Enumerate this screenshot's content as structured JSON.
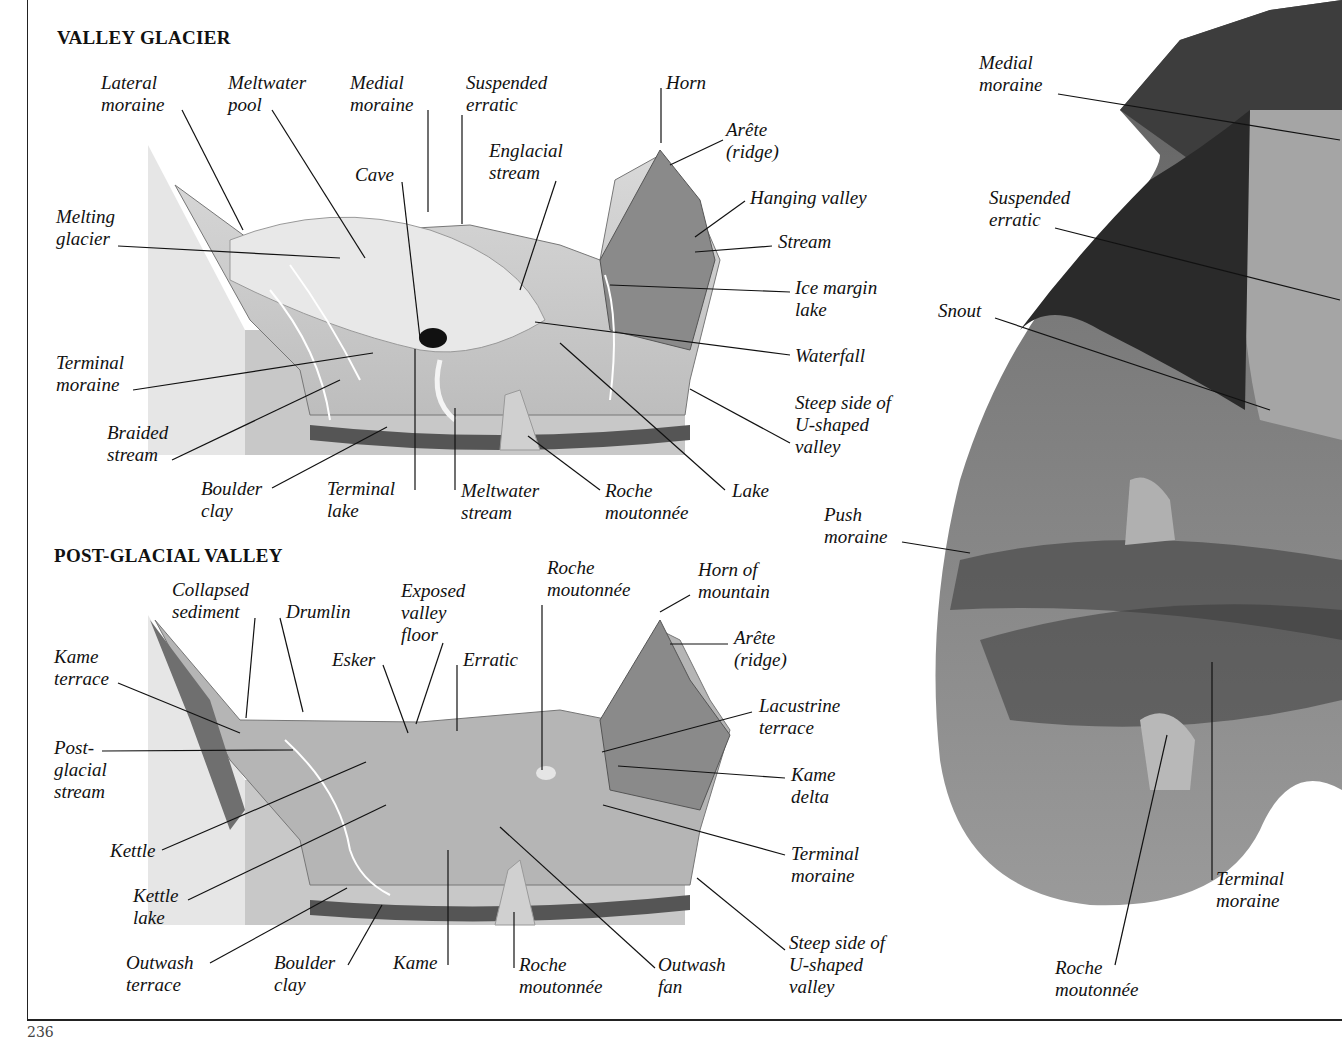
{
  "page": {
    "number": "236"
  },
  "valley_glacier": {
    "title": "VALLEY GLACIER",
    "labels": [
      {
        "id": "lateral-moraine",
        "text": "Lateral\nmoraine",
        "x": 101,
        "y": 72
      },
      {
        "id": "meltwater-pool",
        "text": "Meltwater\npool",
        "x": 228,
        "y": 72
      },
      {
        "id": "medial-moraine",
        "text": "Medial\nmoraine",
        "x": 350,
        "y": 72
      },
      {
        "id": "suspended-erratic",
        "text": "Suspended\nerratic",
        "x": 466,
        "y": 72
      },
      {
        "id": "horn",
        "text": "Horn",
        "x": 666,
        "y": 72
      },
      {
        "id": "arete",
        "text": "Arête\n(ridge)",
        "x": 726,
        "y": 119
      },
      {
        "id": "englacial-stream",
        "text": "Englacial\nstream",
        "x": 489,
        "y": 140
      },
      {
        "id": "cave",
        "text": "Cave",
        "x": 355,
        "y": 164
      },
      {
        "id": "hanging-valley",
        "text": "Hanging valley",
        "x": 750,
        "y": 187
      },
      {
        "id": "melting-glacier",
        "text": "Melting\nglacier",
        "x": 56,
        "y": 206
      },
      {
        "id": "stream",
        "text": "Stream",
        "x": 778,
        "y": 231
      },
      {
        "id": "ice-margin-lake",
        "text": "Ice margin\nlake",
        "x": 795,
        "y": 277
      },
      {
        "id": "waterfall",
        "text": "Waterfall",
        "x": 795,
        "y": 345
      },
      {
        "id": "terminal-moraine",
        "text": "Terminal\nmoraine",
        "x": 56,
        "y": 352
      },
      {
        "id": "steep-side",
        "text": "Steep side of\nU-shaped\nvalley",
        "x": 795,
        "y": 392
      },
      {
        "id": "braided-stream",
        "text": "Braided\nstream",
        "x": 107,
        "y": 422
      },
      {
        "id": "boulder-clay",
        "text": "Boulder\nclay",
        "x": 201,
        "y": 478
      },
      {
        "id": "terminal-lake",
        "text": "Terminal\nlake",
        "x": 327,
        "y": 478
      },
      {
        "id": "meltwater-stream",
        "text": "Meltwater\nstream",
        "x": 461,
        "y": 480
      },
      {
        "id": "roche-moutonnee",
        "text": "Roche\nmoutonnée",
        "x": 605,
        "y": 480
      },
      {
        "id": "lake",
        "text": "Lake",
        "x": 732,
        "y": 480
      }
    ]
  },
  "post_glacial_valley": {
    "title": "POST-GLACIAL VALLEY",
    "labels": [
      {
        "id": "collapsed-sediment",
        "text": "Collapsed\nsediment",
        "x": 172,
        "y": 579
      },
      {
        "id": "drumlin",
        "text": "Drumlin",
        "x": 286,
        "y": 601
      },
      {
        "id": "exposed-valley-floor",
        "text": "Exposed\nvalley\nfloor",
        "x": 401,
        "y": 580
      },
      {
        "id": "roche-moutonnee-top",
        "text": "Roche\nmoutonnée",
        "x": 547,
        "y": 557
      },
      {
        "id": "horn-of-mountain",
        "text": "Horn of\nmountain",
        "x": 698,
        "y": 559
      },
      {
        "id": "arete-2",
        "text": "Arête\n(ridge)",
        "x": 734,
        "y": 627
      },
      {
        "id": "kame-terrace",
        "text": "Kame\nterrace",
        "x": 54,
        "y": 646
      },
      {
        "id": "esker",
        "text": "Esker",
        "x": 332,
        "y": 649
      },
      {
        "id": "erratic",
        "text": "Erratic",
        "x": 463,
        "y": 649
      },
      {
        "id": "lacustrine-terrace",
        "text": "Lacustrine\nterrace",
        "x": 759,
        "y": 695
      },
      {
        "id": "post-glacial-stream",
        "text": "Post-\nglacial\nstream",
        "x": 54,
        "y": 737
      },
      {
        "id": "kame-delta",
        "text": "Kame\ndelta",
        "x": 791,
        "y": 764
      },
      {
        "id": "kettle",
        "text": "Kettle",
        "x": 110,
        "y": 840
      },
      {
        "id": "terminal-moraine-2",
        "text": "Terminal\nmoraine",
        "x": 791,
        "y": 843
      },
      {
        "id": "kettle-lake",
        "text": "Kettle\nlake",
        "x": 133,
        "y": 885
      },
      {
        "id": "steep-side-2",
        "text": "Steep side of\nU-shaped\nvalley",
        "x": 789,
        "y": 932
      },
      {
        "id": "outwash-terrace",
        "text": "Outwash\nterrace",
        "x": 126,
        "y": 952
      },
      {
        "id": "boulder-clay-2",
        "text": "Boulder\nclay",
        "x": 274,
        "y": 952
      },
      {
        "id": "kame",
        "text": "Kame",
        "x": 393,
        "y": 952
      },
      {
        "id": "roche-moutonnee-2",
        "text": "Roche\nmoutonnée",
        "x": 519,
        "y": 954
      },
      {
        "id": "outwash-fan",
        "text": "Outwash\nfan",
        "x": 658,
        "y": 954
      }
    ]
  },
  "photo_model": {
    "labels": [
      {
        "id": "medial-moraine-photo",
        "text": "Medial\nmoraine",
        "x": 979,
        "y": 52
      },
      {
        "id": "suspended-erratic-photo",
        "text": "Suspended\nerratic",
        "x": 989,
        "y": 187
      },
      {
        "id": "snout",
        "text": "Snout",
        "x": 938,
        "y": 300
      },
      {
        "id": "push-moraine",
        "text": "Push\nmoraine",
        "x": 824,
        "y": 504
      },
      {
        "id": "terminal-moraine-photo",
        "text": "Terminal\nmoraine",
        "x": 1216,
        "y": 868
      },
      {
        "id": "roche-moutonnee-photo",
        "text": "Roche\nmoutonnée",
        "x": 1055,
        "y": 957
      }
    ]
  }
}
